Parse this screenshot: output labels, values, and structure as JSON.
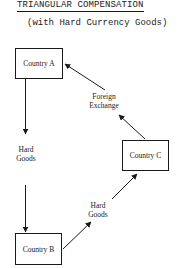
{
  "header": {
    "title": "TRIANGULAR COMPENSATION",
    "subtitle": "(with Hard Currency Goods)"
  },
  "nodes": {
    "country_a": "Country A",
    "country_b": "Country B",
    "country_c": "Country C"
  },
  "edges": {
    "a_to_b": {
      "label_line1": "Hard",
      "label_line2": "Goods"
    },
    "b_to_c": {
      "label_line1": "Hard",
      "label_line2": "Goods"
    },
    "c_to_a": {
      "label_line1": "Foreign",
      "label_line2": "Exchange"
    }
  }
}
